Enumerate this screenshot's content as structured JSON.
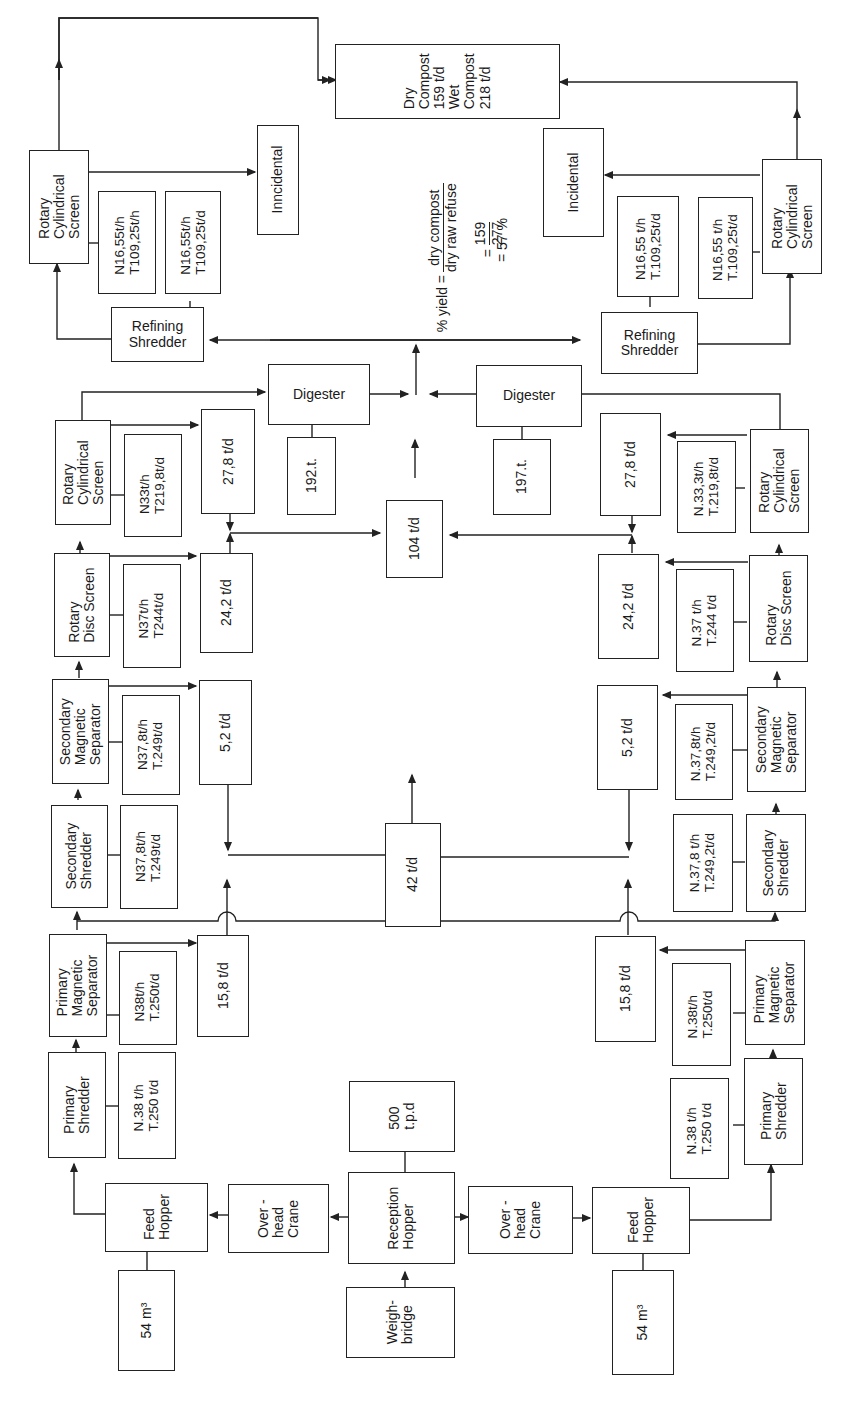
{
  "diagram": {
    "yield_formula": {
      "label": "% yield =",
      "numerator": "dry compost",
      "denominator": "dry raw refuse",
      "step_eq": "=",
      "fraction_num": "159",
      "fraction_den": "277",
      "result": "= 57 %"
    },
    "nodes": {
      "dry_compost": "Dry\nCompost\n159 t/d\nWet\nCompost\n218 t/d",
      "reception_hopper": "Reception\nHopper",
      "weighbridge": "Weigh-\nbridge",
      "capacity": "500\nt.p.d",
      "digester_stats_left": "192.t.",
      "digester_stats_right": "197.t.",
      "central_output_104": "104 t/d",
      "central_output_42": "42 t/d",
      "left": {
        "rotary_cyl_screen_final": "Rotary\nCylindrical\nScreen",
        "final_screen_stats": "N16,55t/h\nT109,25t/h",
        "refining_stats": "N16,55t/h\nT109,25t/d",
        "incidental": "Inncidental",
        "refining_shredder": "Refining\nShredder",
        "digester": "Digester",
        "rotary_cyl_screen": "Rotary\nCylindrical\nScreen",
        "rotary_cyl_stats": "N33t/h\nT219,8t/d",
        "out_27_8": "27,8 t/d",
        "rotary_disc_screen": "Rotary\nDisc Screen",
        "rotary_disc_stats": "N37t/h\nT244t/d",
        "out_24_2": "24,2 t/d",
        "secondary_mag_sep": "Secondary\nMagnetic\nSeparator",
        "secondary_mag_stats": "N37,8t/h\nT.249t/d",
        "out_5_2": "5,2 t/d",
        "secondary_shredder": "Secondary\nShredder",
        "secondary_shredder_stats": "N37,8t/h\nT.249t/d",
        "primary_mag_sep": "Primary\nMagnetic\nSeparator",
        "primary_mag_stats": "N38t/h\nT.250t/d",
        "out_15_8": "15,8 t/d",
        "primary_shredder": "Primary\nShredder",
        "primary_shredder_stats": "N.38 t/h\nT.250 t/d",
        "feed_hopper": "Feed\nHopper",
        "feed_volume": "54 m³",
        "overhead_crane": "Over -\nhead\nCrane"
      },
      "right": {
        "rotary_cyl_screen_final": "Rotary\nCylindrical\nScreen",
        "final_screen_stats": "N16,55 t/h\nT.109,25t/d",
        "refining_stats": "N16,55 t/h\nT.109,25t/d",
        "incidental": "Incidental",
        "refining_shredder": "Refining\nShredder",
        "digester": "Digester",
        "rotary_cyl_screen": "Rotary\nCylindrical\nScreen",
        "rotary_cyl_stats": "N.33,3t/h\nT.219,8t/d",
        "out_27_8": "27,8 t/d",
        "rotary_disc_screen": "Rotary\nDisc Screen",
        "rotary_disc_stats": "N.37 t/h\nT.244 t/d",
        "out_24_2": "24,2 t/d",
        "secondary_mag_sep": "Secondary\nMagnetic\nSeparator",
        "secondary_mag_stats": "N.37,8t/h\nT.249,2t/d",
        "out_5_2": "5,2 t/d",
        "secondary_shredder": "Secondary\nShredder",
        "secondary_shredder_stats": "N.37,8 t/h\nT.249,2t/d",
        "primary_mag_sep": "Primary\nMagnetic\nSeparator",
        "primary_mag_stats": "N.38t/h\nT.250t/d",
        "out_15_8": "15,8 t/d",
        "primary_shredder": "Primary\nShredder",
        "primary_shredder_stats": "N.38 t/h\nT.250 t/d",
        "feed_hopper": "Feed\nHopper",
        "feed_volume": "54 m³",
        "overhead_crane": "Over -\nhead\nCrane"
      }
    }
  }
}
